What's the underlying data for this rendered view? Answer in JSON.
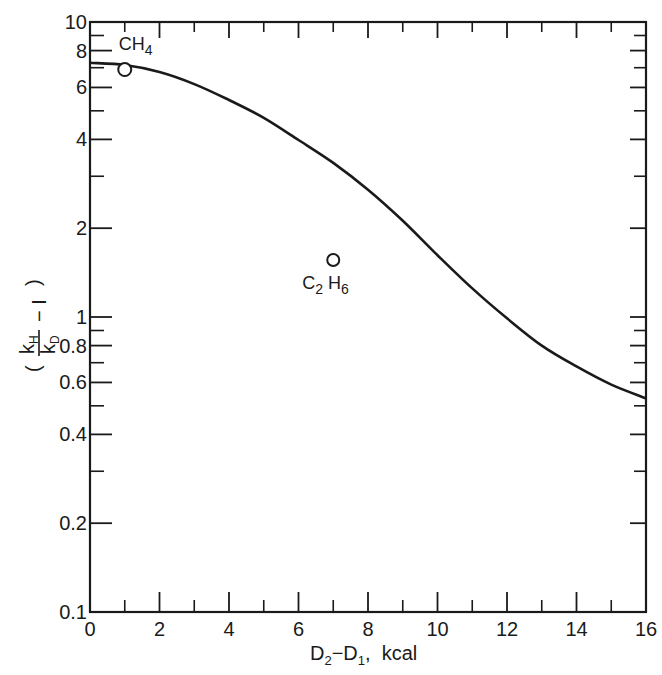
{
  "chart_data": {
    "type": "line",
    "title": "",
    "xlabel": "D2 - D1, kcal",
    "xlabel_parts": {
      "main1": "D",
      "sub1": "2",
      "mid": "−D",
      "sub2": "1",
      "tail": ",  kcal"
    },
    "ylabel": "(kH/kD - 1)",
    "ylabel_parts": {
      "k1": "k",
      "k1_sub": "H",
      "k2": "k",
      "k2_sub": "D",
      "minus_one": "− I"
    },
    "xlim": [
      0,
      16
    ],
    "ylim": [
      0.1,
      10
    ],
    "yscale": "log",
    "grid": false,
    "legend": null,
    "x_ticks": [
      0,
      2,
      4,
      6,
      8,
      10,
      12,
      14,
      16
    ],
    "x_tick_labels": [
      "0",
      "2",
      "4",
      "6",
      "8",
      "10",
      "12",
      "14",
      "16"
    ],
    "x_minor_ticks": [
      1,
      3,
      5,
      7,
      9,
      11,
      13,
      15
    ],
    "y_ticks": [
      0.1,
      0.2,
      0.4,
      0.6,
      0.8,
      1,
      2,
      4,
      6,
      8,
      10
    ],
    "y_tick_labels": [
      "0.1",
      "0.2",
      "0.4",
      "0.6",
      "0.8",
      "1",
      "2",
      "4",
      "6",
      "8",
      "10"
    ],
    "y_minor_ticks": [
      0.3,
      0.5,
      0.7,
      0.9,
      3,
      5,
      7,
      9
    ],
    "series": [
      {
        "name": "calculated curve",
        "style": "line",
        "x": [
          0,
          1,
          2,
          3,
          4,
          5,
          6,
          7,
          8,
          9,
          10,
          11,
          12,
          13,
          14,
          15,
          16
        ],
        "values": [
          7.27,
          7.15,
          6.77,
          6.16,
          5.44,
          4.73,
          3.98,
          3.33,
          2.7,
          2.12,
          1.62,
          1.25,
          0.99,
          0.8,
          0.68,
          0.59,
          0.53
        ]
      },
      {
        "name": "experimental points",
        "style": "open-circle",
        "points": [
          {
            "label": "CH4",
            "label_main": "CH",
            "label_sub": "4",
            "x": 1.0,
            "y": 6.9
          },
          {
            "label": "C2H6",
            "label_main1": "C",
            "label_sub1": "2",
            "label_main2": "H",
            "label_sub2": "6",
            "x": 7.0,
            "y": 1.56
          }
        ]
      }
    ],
    "colors": {
      "line": "#1a1a1a",
      "background": "#ffffff"
    }
  }
}
